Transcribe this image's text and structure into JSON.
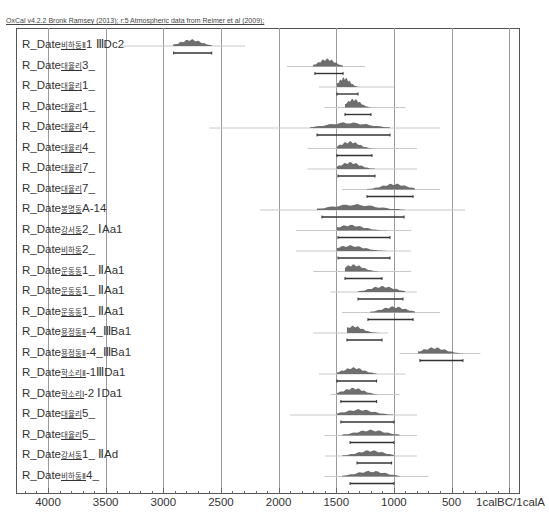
{
  "header": {
    "title": "OxCal v4.2.2 Bronk Ramsey (2013); r:5 Atmospheric data from Reimer et al (2009);"
  },
  "chart_data": {
    "type": "area",
    "title": "OxCal v4.2.2 Bronk Ramsey (2013); r:5 Atmospheric data from Reimer et al (2009);",
    "xlabel": "calBC/calAD",
    "x_axis_reversed": true,
    "x_ticks": [
      4000,
      3500,
      3000,
      2500,
      2000,
      1500,
      1000,
      500,
      1
    ],
    "x_tick_labels": [
      "4000",
      "3500",
      "3000",
      "2500",
      "2000",
      "1500",
      "1000",
      "500",
      "1calBC/1calAD"
    ],
    "grid": true,
    "series": [
      {
        "name": "R_Date비하동Ⅱ1 Ⅲ Dc2",
        "prior": [
          3376,
          2291
        ],
        "posterior": [
          2916,
          2578
        ],
        "range_2sigma": [
          2910,
          2580
        ],
        "peak": 2760
      },
      {
        "name": "R_Date대율리3_",
        "prior": [
          1927,
          1251
        ],
        "posterior": [
          1702,
          1441
        ],
        "range_2sigma": [
          1685,
          1441
        ],
        "peak": 1580
      },
      {
        "name": "R_Date대율리1_",
        "prior": [
          1650,
          1000
        ],
        "posterior": [
          1494,
          1311
        ],
        "range_2sigma": [
          1494,
          1311
        ],
        "peak": 1430
      },
      {
        "name": "R_Date대율리1_",
        "prior": [
          1600,
          900
        ],
        "posterior": [
          1424,
          1199
        ],
        "range_2sigma": [
          1424,
          1199
        ],
        "peak": 1350
      },
      {
        "name": "R_Date대율리4_",
        "prior": [
          2600,
          600
        ],
        "posterior": [
          1728,
          1034
        ],
        "range_2sigma": [
          1667,
          1034
        ],
        "peak": 1400
      },
      {
        "name": "R_Date대율리4_",
        "prior": [
          1750,
          800
        ],
        "posterior": [
          1494,
          1190
        ],
        "range_2sigma": [
          1494,
          1190
        ],
        "peak": 1380
      },
      {
        "name": "R_Date대율리7_",
        "prior": [
          1750,
          800
        ],
        "posterior": [
          1494,
          1164
        ],
        "range_2sigma": [
          1485,
          1164
        ],
        "peak": 1380
      },
      {
        "name": "R_Date대율리7_",
        "prior": [
          1450,
          600
        ],
        "posterior": [
          1233,
          817
        ],
        "range_2sigma": [
          1233,
          834
        ],
        "peak": 1000
      },
      {
        "name": "R_Date봉명동A-14",
        "prior": [
          2161,
          383
        ],
        "posterior": [
          1667,
          904
        ],
        "range_2sigma": [
          1624,
          912
        ],
        "peak": 1350
      },
      {
        "name": "R_Date강서동2_ⅠAa1",
        "prior": [
          1850,
          850
        ],
        "posterior": [
          1494,
          1034
        ],
        "range_2sigma": [
          1485,
          1034
        ],
        "peak": 1380
      },
      {
        "name": "R_Date비하동2_",
        "prior": [
          1850,
          850
        ],
        "posterior": [
          1494,
          1034
        ],
        "range_2sigma": [
          1485,
          1034
        ],
        "peak": 1380
      },
      {
        "name": "R_Date운동동1_ⅡAa1",
        "prior": [
          1700,
          850
        ],
        "posterior": [
          1424,
          1103
        ],
        "range_2sigma": [
          1424,
          1103
        ],
        "peak": 1350
      },
      {
        "name": "R_Date운동동1_ⅡAa1",
        "prior": [
          1550,
          800
        ],
        "posterior": [
          1311,
          904
        ],
        "range_2sigma": [
          1311,
          921
        ],
        "peak": 1100
      },
      {
        "name": "R_Date운동동1_ⅡAa1",
        "prior": [
          1450,
          600
        ],
        "posterior": [
          1207,
          817
        ],
        "range_2sigma": [
          1225,
          834
        ],
        "peak": 1000
      },
      {
        "name": "R_Date용정동Ⅱ-4_ⅢBa1",
        "prior": [
          1700,
          1050
        ],
        "posterior": [
          1407,
          1103
        ],
        "range_2sigma": [
          1407,
          1103
        ],
        "peak": 1350
      },
      {
        "name": "R_Date용정동Ⅱ-4_ⅢBa1",
        "prior": [
          950,
          250
        ],
        "posterior": [
          791,
          401
        ],
        "range_2sigma": [
          774,
          401
        ],
        "peak": 650
      },
      {
        "name": "R_Date학소리Ⅱ-1ⅢDa1",
        "prior": [
          1650,
          900
        ],
        "posterior": [
          1494,
          1150
        ],
        "range_2sigma": [
          1494,
          1150
        ],
        "peak": 1350
      },
      {
        "name": "R_Date학소리Ⅰ-2 ⅠDa1",
        "prior": [
          1550,
          950
        ],
        "posterior": [
          1494,
          1150
        ],
        "range_2sigma": [
          1460,
          1150
        ],
        "peak": 1350
      },
      {
        "name": "R_Date대율리5_",
        "prior": [
          1900,
          800
        ],
        "posterior": [
          1494,
          1000
        ],
        "range_2sigma": [
          1460,
          1000
        ],
        "peak": 1300
      },
      {
        "name": "R_Date대율리5_",
        "prior": [
          1600,
          800
        ],
        "posterior": [
          1450,
          950
        ],
        "range_2sigma": [
          1380,
          1000
        ],
        "peak": 1200
      },
      {
        "name": "R_Date강서동1_ⅡAd",
        "prior": [
          1600,
          800
        ],
        "posterior": [
          1450,
          1000
        ],
        "range_2sigma": [
          1320,
          1020
        ],
        "peak": 1200
      },
      {
        "name": "R_Date비하동Ⅱ4_",
        "prior": [
          1600,
          700
        ],
        "posterior": [
          1450,
          950
        ],
        "range_2sigma": [
          1380,
          1000
        ],
        "peak": 1200
      }
    ]
  },
  "rows": [
    {
      "prefix": "R_Date",
      "site": "비하동Ⅱ",
      "tail": "1 ⅢDc2"
    },
    {
      "prefix": "R_Date",
      "site": "대율리",
      "tail": "3_"
    },
    {
      "prefix": "R_Date",
      "site": "대율리",
      "tail": "1_"
    },
    {
      "prefix": "R_Date",
      "site": "대율리",
      "tail": "1_"
    },
    {
      "prefix": "R_Date",
      "site": "대율리",
      "tail": "4_"
    },
    {
      "prefix": "R_Date",
      "site": "대율리",
      "tail": "4_"
    },
    {
      "prefix": "R_Date",
      "site": "대율리",
      "tail": "7_"
    },
    {
      "prefix": "R_Date",
      "site": "대율리",
      "tail": "7_"
    },
    {
      "prefix": "R_Date",
      "site": "봉명동",
      "tail": "A-14"
    },
    {
      "prefix": "R_Date",
      "site": "강서동",
      "tail": "2_ ⅠAa1"
    },
    {
      "prefix": "R_Date",
      "site": "비하동",
      "tail": "2_"
    },
    {
      "prefix": "R_Date",
      "site": "운동동",
      "tail": "1_ ⅡAa1"
    },
    {
      "prefix": "R_Date",
      "site": "운동동",
      "tail": "1_ ⅡAa1"
    },
    {
      "prefix": "R_Date",
      "site": "운동동",
      "tail": "1_ ⅡAa1"
    },
    {
      "prefix": "R_Date",
      "site": "용정동Ⅱ",
      "tail": "-4_ⅢBa1"
    },
    {
      "prefix": "R_Date",
      "site": "용정동Ⅱ",
      "tail": "-4_ⅢBa1"
    },
    {
      "prefix": "R_Date",
      "site": "학소리Ⅱ",
      "tail": "-1ⅢDa1"
    },
    {
      "prefix": "R_Date",
      "site": "학소리Ⅰ",
      "tail": "-2 ⅠDa1"
    },
    {
      "prefix": "R_Date",
      "site": "대율리",
      "tail": "5_"
    },
    {
      "prefix": "R_Date",
      "site": "대율리",
      "tail": "5_"
    },
    {
      "prefix": "R_Date",
      "site": "강서동",
      "tail": "1_ ⅡAd"
    },
    {
      "prefix": "R_Date",
      "site": "비하동Ⅱ",
      "tail": "4_"
    }
  ],
  "axis": {
    "labels": [
      "4000",
      "3500",
      "3000",
      "2500",
      "2000",
      "1500",
      "1000",
      "500",
      "1calBC/1calA"
    ]
  },
  "colors": {
    "fill": "#6e6e6e",
    "prior": "#c8c8c8",
    "grid": "#9a9a9a",
    "bar": "#333333"
  }
}
